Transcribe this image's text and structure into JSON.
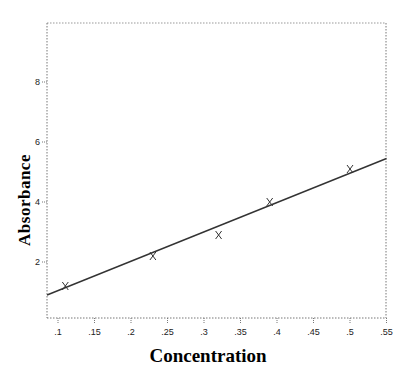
{
  "chart_data": {
    "type": "scatter",
    "title": "",
    "xlabel": "Concentration",
    "ylabel": "Absorbance",
    "xlim": [
      0.085,
      0.55
    ],
    "ylim": [
      0.15,
      10
    ],
    "x_ticks": [
      0.1,
      0.15,
      0.2,
      0.25,
      0.3,
      0.35,
      0.4,
      0.45,
      0.5,
      0.55
    ],
    "x_tick_labels": [
      ".1",
      ".15",
      ".2",
      ".25",
      ".3",
      ".35",
      ".4",
      ".45",
      ".5",
      ".55"
    ],
    "y_ticks": [
      2,
      4,
      6,
      8
    ],
    "y_tick_labels": [
      "2",
      "4",
      "6",
      "8"
    ],
    "grid": false,
    "legend": null,
    "series": [
      {
        "name": "Observed",
        "type": "scatter",
        "marker": "x",
        "x": [
          0.11,
          0.23,
          0.32,
          0.39,
          0.5
        ],
        "y": [
          1.2,
          2.2,
          2.9,
          4.0,
          5.1
        ]
      },
      {
        "name": "Fitted line",
        "type": "line",
        "x": [
          0.085,
          0.55
        ],
        "y": [
          0.9,
          5.45
        ]
      }
    ]
  }
}
